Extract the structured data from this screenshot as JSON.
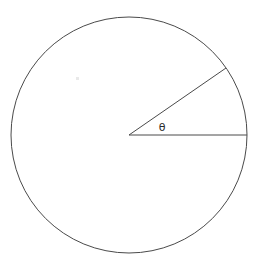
{
  "figure": {
    "background_color": "#ffffff",
    "width": 258,
    "height": 268,
    "stroke_color": "#4a4a4a",
    "stroke_width": 1,
    "label_color": "#2b2b2b"
  },
  "labels": {
    "theta": "θ",
    "theta_name": "central-angle-theta"
  },
  "chart_data": {
    "type": "diagram",
    "subtitle": "",
    "xlabel": "",
    "ylabel": "",
    "grid": false,
    "legend": null,
    "shapes": [
      {
        "name": "circle-outline",
        "kind": "circle",
        "cx": 129,
        "cy": 135,
        "r": 118,
        "fill": "none",
        "stroke": "#4a4a4a",
        "stroke_width": 1
      },
      {
        "name": "radius-horizontal",
        "kind": "line",
        "x1": 129,
        "y1": 135,
        "x2": 247,
        "y2": 135,
        "angle_deg": 0,
        "length": 118,
        "stroke": "#4a4a4a",
        "stroke_width": 1
      },
      {
        "name": "radius-upper",
        "kind": "line",
        "x1": 129,
        "y1": 135,
        "x2": 226,
        "y2": 68,
        "angle_deg": 34.6,
        "length": 118,
        "stroke": "#4a4a4a",
        "stroke_width": 1
      }
    ],
    "annotations": [
      {
        "name": "theta-label",
        "text": "θ",
        "x": 162,
        "y": 128,
        "font_size": 11,
        "color": "#2b2b2b"
      }
    ],
    "artifacts": [
      {
        "name": "faint-speck",
        "x": 77,
        "y": 78,
        "w": 3,
        "h": 3,
        "color": "#e9e9e9"
      }
    ],
    "measured": {
      "center": [
        129,
        135
      ],
      "radius": 118,
      "central_angle_degrees": 34.6,
      "circle_bbox": [
        11,
        17,
        247,
        253
      ]
    }
  }
}
